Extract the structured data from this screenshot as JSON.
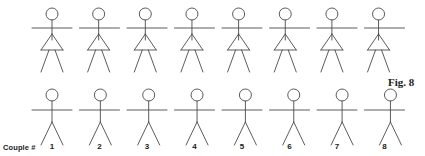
{
  "figure": {
    "caption": "Fig. 8",
    "caption_x": 388,
    "caption_y": 76,
    "background_color": "#ffffff",
    "stroke_color": "#4a4a4a",
    "stroke_width": 0.9
  },
  "axis_label": {
    "text": "Couple #",
    "x": 3,
    "y": 143
  },
  "columns": {
    "count": 8,
    "first_center_x": 52,
    "spacing_x": 47.5,
    "numbers": [
      "1",
      "2",
      "3",
      "4",
      "5",
      "6",
      "7",
      "8"
    ],
    "number_y": 142
  },
  "rows": [
    {
      "name": "top-row",
      "role": "female-figure",
      "has_skirt": true,
      "head_center_y": 14,
      "head_radius": 6,
      "neck_top_y": 20,
      "shoulder_y": 28,
      "torso_bottom_y": 40,
      "arm_half_length": 20,
      "skirt_apex_y": 34,
      "skirt_bottom_y": 50,
      "skirt_half_width": 11,
      "leg_bottom_y": 72,
      "leg_spread": 11
    },
    {
      "name": "bottom-row",
      "role": "male-figure",
      "has_skirt": false,
      "head_center_y": 95,
      "head_radius": 6,
      "neck_top_y": 101,
      "shoulder_y": 110,
      "torso_bottom_y": 122,
      "arm_half_length": 20,
      "leg_bottom_y": 145,
      "leg_spread": 11
    }
  ],
  "chart_data": {
    "type": "diagram",
    "title": "Fig. 8",
    "xlabel": "Couple #",
    "categories": [
      "1",
      "2",
      "3",
      "4",
      "5",
      "6",
      "7",
      "8"
    ],
    "series": [
      {
        "name": "top-row-arm-offset",
        "values": [
          0,
          1,
          2,
          3,
          4,
          5,
          6,
          7
        ]
      },
      {
        "name": "bottom-row-arm-offset",
        "values": [
          0,
          -1,
          -2,
          -3,
          -4,
          -5,
          -6,
          -7
        ]
      }
    ]
  }
}
